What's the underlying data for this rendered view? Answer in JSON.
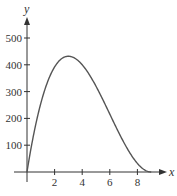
{
  "chart_data": {
    "type": "line",
    "title": "",
    "xlabel": "x",
    "ylabel": "y",
    "xlim": [
      0,
      9.5
    ],
    "ylim": [
      0,
      550
    ],
    "grid": false,
    "legend": "none",
    "x_ticks": [
      2,
      4,
      6,
      8
    ],
    "y_ticks": [
      100,
      200,
      300,
      400,
      500
    ],
    "x_tick_labels": [
      "2",
      "4",
      "6",
      "8"
    ],
    "y_tick_labels": [
      "100",
      "200",
      "300",
      "400",
      "500"
    ],
    "series": [
      {
        "name": "y",
        "x": [
          0,
          0.5,
          1,
          1.5,
          2,
          2.5,
          3,
          3.5,
          4,
          4.5,
          5,
          5.5,
          6,
          6.5,
          7,
          7.5,
          8,
          8.5,
          9
        ],
        "values": [
          0,
          151,
          256,
          338,
          392,
          423,
          432,
          424,
          400,
          365,
          320,
          270,
          216,
          163,
          112,
          68,
          32,
          9,
          0
        ]
      }
    ],
    "annotations": [
      "maximum near x = 3, y ≈ 430"
    ]
  },
  "colors": {
    "curve": "#555555",
    "axes": "#333333"
  }
}
